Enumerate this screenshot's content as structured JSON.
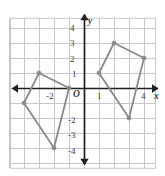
{
  "figure": {
    "type": "coordinate-plane-diagram",
    "title": "",
    "background_color": "#ffffff"
  },
  "colors": {
    "grid": "#c9c5d2",
    "grid_border": "#c9c5d2",
    "axis": "#1f1f1f",
    "shape_stroke": "#8a8a8a",
    "vertex_dot": "#8a8a8a",
    "label_text": "#3b3b3b"
  },
  "axes": {
    "x_axis_label": "x",
    "y_axis_label": "y",
    "origin_label": "O",
    "x_range": [
      -5,
      5
    ],
    "y_range": [
      -5,
      5
    ],
    "grid": true,
    "grid_step": 1,
    "arrowheads": [
      "x-negative",
      "x-positive",
      "y-negative",
      "y-positive"
    ],
    "x_tick_labels": [
      {
        "value": -2,
        "text": "-2"
      },
      {
        "value": 1,
        "text": "1"
      },
      {
        "value": 4,
        "text": "4"
      }
    ],
    "y_tick_labels": [
      {
        "value": 4,
        "text": "4"
      },
      {
        "value": 3,
        "text": "3"
      },
      {
        "value": 2,
        "text": "2"
      },
      {
        "value": 1,
        "text": "1"
      },
      {
        "value": -2,
        "text": "-2"
      },
      {
        "value": -3,
        "text": "-3"
      },
      {
        "value": -4,
        "text": "-4"
      }
    ]
  },
  "chart_data": {
    "type": "scatter",
    "title": "",
    "xlabel": "x",
    "ylabel": "y",
    "xlim": [
      -5,
      5
    ],
    "ylim": [
      -5,
      5
    ],
    "grid": true,
    "series": [
      {
        "name": "left-quadrilateral",
        "closed": true,
        "points": [
          {
            "x": -3,
            "y": 1
          },
          {
            "x": -1,
            "y": 0
          },
          {
            "x": -2,
            "y": -4
          },
          {
            "x": -4,
            "y": -1
          }
        ]
      },
      {
        "name": "right-quadrilateral",
        "closed": true,
        "points": [
          {
            "x": 2,
            "y": 3
          },
          {
            "x": 4,
            "y": 2
          },
          {
            "x": 3,
            "y": -2
          },
          {
            "x": 1,
            "y": 1
          }
        ]
      }
    ]
  }
}
